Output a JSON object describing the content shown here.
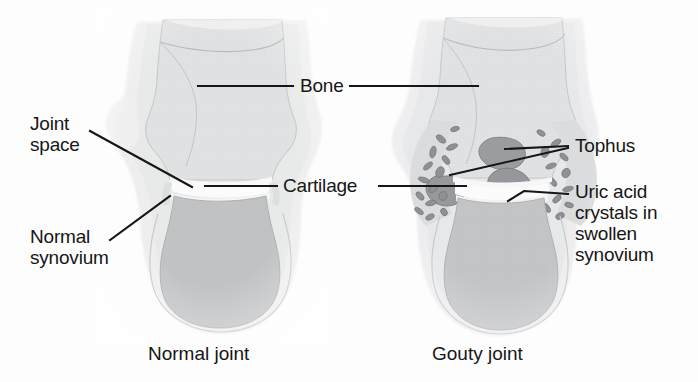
{
  "figure": {
    "background_color": "#fdfdfd",
    "ink_color": "#161616"
  },
  "labels": [
    {
      "id": "bone",
      "text": "Bone",
      "x": 300,
      "y": 78
    },
    {
      "id": "joint_space",
      "text": "Joint\nspace",
      "x": 30,
      "y": 115
    },
    {
      "id": "cartilage",
      "text": "Cartilage",
      "x": 283,
      "y": 176
    },
    {
      "id": "normal_synovium",
      "text": "Normal\nsynovium",
      "x": 30,
      "y": 228
    },
    {
      "id": "tophus",
      "text": "Tophus",
      "x": 575,
      "y": 136
    },
    {
      "id": "uric_acid",
      "text": "Uric acid\ncrystals in\nswollen\nsynovium",
      "x": 575,
      "y": 182
    }
  ],
  "captions": [
    {
      "id": "normal_joint",
      "text": "Normal joint",
      "x": 148,
      "y": 343
    },
    {
      "id": "gouty_joint",
      "text": "Gouty joint",
      "x": 432,
      "y": 343
    }
  ],
  "leader_lines": [
    {
      "id": "bone-left",
      "points": "198,86 293,86"
    },
    {
      "id": "bone-right",
      "points": "350,86 478,86"
    },
    {
      "id": "joint-space",
      "points": "90,131 192,187"
    },
    {
      "id": "cartilage-left",
      "points": "205,186 277,186"
    },
    {
      "id": "cartilage-right",
      "points": "379,186 466,186"
    },
    {
      "id": "normal-synovium",
      "points": "110,240 170,196"
    },
    {
      "id": "tophus-upper",
      "points": "568,146 505,149"
    },
    {
      "id": "tophus-lower",
      "points": "568,148 450,175"
    },
    {
      "id": "uric-acid",
      "points": "568,194 524,191 510,200"
    }
  ],
  "joints": {
    "normal": {
      "name": "Normal joint",
      "structures": [
        "upper bone",
        "joint space",
        "cartilage",
        "lower bone",
        "normal synovium",
        "soft tissue"
      ]
    },
    "gouty": {
      "name": "Gouty joint",
      "structures": [
        "upper bone",
        "joint space",
        "cartilage",
        "lower bone",
        "tophus",
        "uric acid crystals",
        "swollen synovium"
      ]
    }
  },
  "palette": {
    "soft_tissue": "#ededee",
    "soft_tissue_edge": "#dcdcde",
    "bone_light": "#e2e3e4",
    "bone_mid": "#d2d3d5",
    "bone_dark": "#c1c3c5",
    "marrow": "#bcbec1",
    "cartilage": "#f7f7f7",
    "synovium_gouty": "#d9dadc",
    "crystal": "#8f9195",
    "crystal_edge": "#707276",
    "tophus": "#9a9ca0",
    "outline": "#b9babd"
  }
}
